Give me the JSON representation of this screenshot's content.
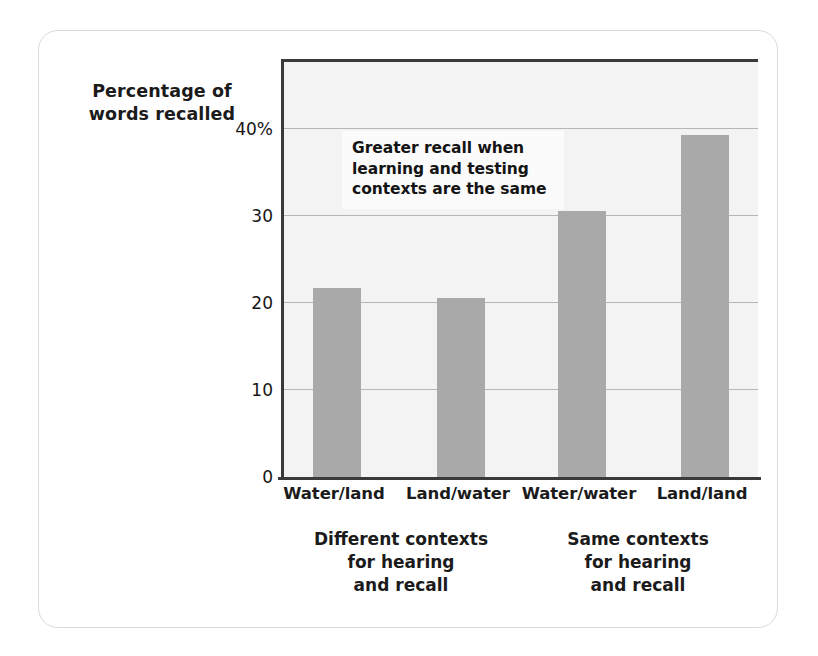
{
  "figure": {
    "y_axis_title_line1": "Percentage of",
    "y_axis_title_line2": "words recalled",
    "annotation_line1": "Greater recall when",
    "annotation_line2": "learning and testing",
    "annotation_line3": "contexts are the same",
    "group_caption_left_line1": "Different contexts",
    "group_caption_left_line2": "for hearing",
    "group_caption_left_line3": "and recall",
    "group_caption_right_line1": "Same contexts",
    "group_caption_right_line2": "for hearing",
    "group_caption_right_line3": "and recall",
    "bar_color": "#a9a9a9",
    "plot_background": "#f3f3f3",
    "gridline_color": "#b6b6b6",
    "axis_color": "#3a3a3a",
    "frame_border_color": "#d9d9d9"
  },
  "chart_data": {
    "type": "bar",
    "title": "",
    "xlabel": "",
    "ylabel": "Percentage of words recalled",
    "categories": [
      "Water/land",
      "Land/water",
      "Water/water",
      "Land/land"
    ],
    "values": [
      21.7,
      20.5,
      30.6,
      39.3
    ],
    "ylim": [
      0,
      48
    ],
    "yticks": [
      0,
      10,
      20,
      30,
      40
    ],
    "ytick_labels": [
      "0",
      "10",
      "20",
      "30",
      "40%"
    ],
    "grid": true,
    "legend": "none",
    "annotations": [
      {
        "text": "Greater recall when learning and testing contexts are the same",
        "x_category": "Land/water",
        "y_value": 44
      }
    ],
    "group_labels": [
      {
        "label": "Different contexts for hearing and recall",
        "categories": [
          "Water/land",
          "Land/water"
        ]
      },
      {
        "label": "Same contexts for hearing and recall",
        "categories": [
          "Water/water",
          "Land/land"
        ]
      }
    ]
  }
}
